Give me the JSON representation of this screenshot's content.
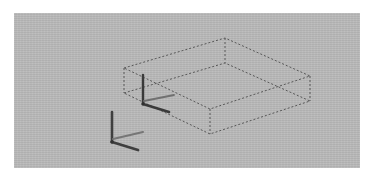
{
  "app": {
    "title": "3D Viewport",
    "view_mode": "Isometric Wireframe",
    "background_color": "#b9b9b9",
    "frame_color": "#ffffff"
  },
  "viewport": {
    "name": "perspective-viewport",
    "x": 14,
    "y": 13,
    "width": 346,
    "height": 155
  },
  "scene": {
    "selection_box": {
      "label": "Selected Bounding Box",
      "style": "dashed",
      "stroke_color": "#4a4a4a",
      "dash_pattern": "2 2",
      "stroke_width": 1,
      "top_face": [
        [
          110,
          55
        ],
        [
          211,
          25
        ],
        [
          296,
          63
        ],
        [
          196,
          96
        ]
      ],
      "bottom_face": [
        [
          110,
          80
        ],
        [
          211,
          50
        ],
        [
          296,
          88
        ],
        [
          196,
          121
        ]
      ],
      "vertical_edges": [
        [
          [
            110,
            55
          ],
          [
            110,
            80
          ]
        ],
        [
          [
            211,
            25
          ],
          [
            211,
            50
          ]
        ],
        [
          [
            296,
            63
          ],
          [
            296,
            88
          ]
        ],
        [
          [
            196,
            96
          ],
          [
            196,
            121
          ]
        ]
      ]
    },
    "object_gizmo": {
      "label": "Object Transform Gizmo",
      "origin": [
        129,
        91
      ],
      "color": "#3a3a3a",
      "axes": [
        {
          "name": "z-axis-up",
          "to": [
            129,
            62
          ],
          "color": "#3a3a3a"
        },
        {
          "name": "x-axis",
          "to": [
            155,
            99
          ],
          "color": "#3a3a3a"
        },
        {
          "name": "y-axis",
          "to": [
            160,
            82
          ],
          "color": "#6e6e6e"
        }
      ]
    },
    "world_gizmo": {
      "label": "World Axis Gizmo",
      "origin": [
        98,
        129
      ],
      "color": "#3f3f3f",
      "axes": [
        {
          "name": "z-axis-up",
          "to": [
            98,
            99
          ],
          "color": "#3f3f3f"
        },
        {
          "name": "x-axis",
          "to": [
            124,
            137
          ],
          "color": "#3f3f3f"
        },
        {
          "name": "y-axis",
          "to": [
            129,
            119
          ],
          "color": "#757575"
        }
      ]
    }
  }
}
